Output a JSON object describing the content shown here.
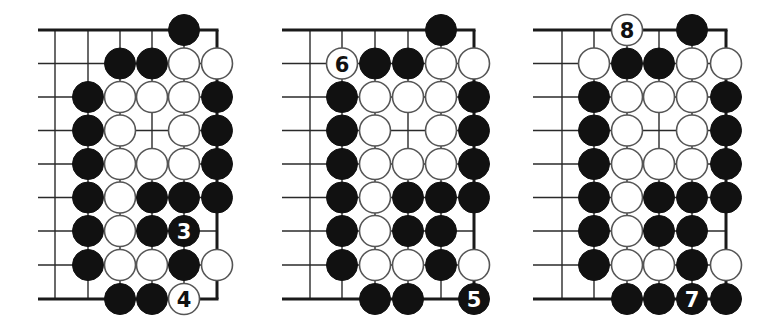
{
  "figure": {
    "title": ""
  },
  "geometry": {
    "stone_radius": 15.5,
    "row_y": [
      30,
      63.5,
      97,
      130.5,
      164,
      197.5,
      231,
      265,
      299
    ],
    "open_left_extent": 17
  },
  "boards": [
    {
      "id": "diagram-1",
      "left_edge_x": 38,
      "col_x": [
        55,
        88,
        120,
        152,
        184,
        217
      ],
      "rows": [
        [
          "",
          "",
          "",
          "",
          "B",
          ""
        ],
        [
          "",
          "",
          "B",
          "B",
          "W",
          "W"
        ],
        [
          "",
          "B",
          "W",
          "W",
          "W",
          "B"
        ],
        [
          "",
          "B",
          "W",
          "",
          "W",
          "B"
        ],
        [
          "",
          "B",
          "W",
          "W",
          "W",
          "B"
        ],
        [
          "",
          "B",
          "W",
          "B",
          "B",
          "B"
        ],
        [
          "",
          "B",
          "W",
          "B",
          "B:3",
          ""
        ],
        [
          "",
          "B",
          "W",
          "W",
          "B",
          "W"
        ],
        [
          "",
          "",
          "B",
          "B",
          "W:4",
          ""
        ]
      ],
      "move_labels": [
        "3",
        "4"
      ]
    },
    {
      "id": "diagram-2",
      "left_edge_x": 282,
      "col_x": [
        310,
        342,
        375,
        408,
        441,
        474
      ],
      "rows": [
        [
          "",
          "",
          "",
          "",
          "B",
          ""
        ],
        [
          "",
          "W:6",
          "B",
          "B",
          "W",
          "W"
        ],
        [
          "",
          "B",
          "W",
          "W",
          "W",
          "B"
        ],
        [
          "",
          "B",
          "W",
          "",
          "W",
          "B"
        ],
        [
          "",
          "B",
          "W",
          "W",
          "W",
          "B"
        ],
        [
          "",
          "B",
          "W",
          "B",
          "B",
          "B"
        ],
        [
          "",
          "B",
          "W",
          "B",
          "B",
          ""
        ],
        [
          "",
          "B",
          "W",
          "W",
          "B",
          "W"
        ],
        [
          "",
          "",
          "B",
          "B",
          "",
          "B:5"
        ]
      ],
      "move_labels": [
        "5",
        "6"
      ]
    },
    {
      "id": "diagram-3",
      "left_edge_x": 533,
      "col_x": [
        562,
        594,
        627,
        659,
        692,
        726
      ],
      "rows": [
        [
          "",
          "",
          "W:8",
          "",
          "B",
          ""
        ],
        [
          "",
          "W",
          "B",
          "B",
          "W",
          "W"
        ],
        [
          "",
          "B",
          "W",
          "W",
          "W",
          "B"
        ],
        [
          "",
          "B",
          "W",
          "",
          "W",
          "B"
        ],
        [
          "",
          "B",
          "W",
          "W",
          "W",
          "B"
        ],
        [
          "",
          "B",
          "W",
          "B",
          "B",
          "B"
        ],
        [
          "",
          "B",
          "W",
          "B",
          "B",
          ""
        ],
        [
          "",
          "B",
          "W",
          "W",
          "B",
          "W"
        ],
        [
          "",
          "",
          "B",
          "B",
          "B:7",
          "B"
        ]
      ],
      "move_labels": [
        "7",
        "8"
      ]
    }
  ],
  "colors": {
    "black_stone": "#111111",
    "white_stone": "#ffffff",
    "white_stone_outline": "#555555",
    "grid": "#2a2a2a",
    "background": "#ffffff"
  }
}
